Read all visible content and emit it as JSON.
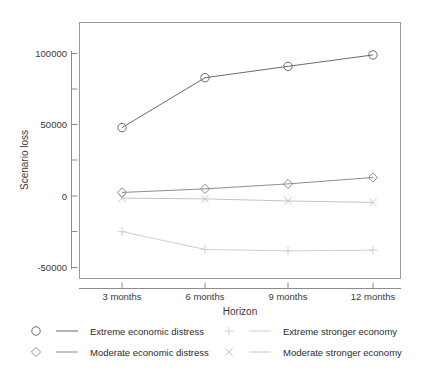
{
  "chart_data": {
    "type": "line",
    "title": "",
    "xlabel": "Horizon",
    "ylabel": "Scenario loss",
    "categories": [
      "3 months",
      "6 months",
      "9 months",
      "12 months"
    ],
    "ytick_labels": [
      "100000",
      "50000",
      "0",
      "-50000"
    ],
    "ytick_values": [
      100000,
      50000,
      0,
      -50000
    ],
    "yminor_ticks": [
      75000,
      25000,
      -25000
    ],
    "ylim": [
      -57000,
      120000
    ],
    "grid": false,
    "legend_position": "bottom",
    "series": [
      {
        "name": "Extreme economic distress",
        "marker": "circle",
        "color": "#6b6b6b",
        "values": [
          48000,
          83000,
          91000,
          99000
        ]
      },
      {
        "name": "Moderate economic distress",
        "marker": "diamond",
        "color": "#8d8d8d",
        "values": [
          2500,
          5000,
          8500,
          13000
        ]
      },
      {
        "name": "Extreme stronger economy",
        "marker": "plus",
        "color": "#cfcfcf",
        "values": [
          -25000,
          -37500,
          -38500,
          -38000
        ]
      },
      {
        "name": "Moderate stronger economy",
        "marker": "cross",
        "color": "#c4c4c4",
        "values": [
          -1500,
          -2000,
          -3500,
          -4500
        ]
      }
    ]
  },
  "legend": {
    "entries": [
      {
        "label": "Extreme economic distress",
        "marker": "circle",
        "color": "#6b6b6b"
      },
      {
        "label": "Moderate economic distress",
        "marker": "diamond",
        "color": "#8d8d8d"
      },
      {
        "label": "Extreme stronger economy",
        "marker": "plus",
        "color": "#cfcfcf"
      },
      {
        "label": "Moderate stronger economy",
        "marker": "cross",
        "color": "#c4c4c4"
      }
    ]
  },
  "axes": {
    "x_title": "Horizon",
    "y_title": "Scenario loss"
  }
}
